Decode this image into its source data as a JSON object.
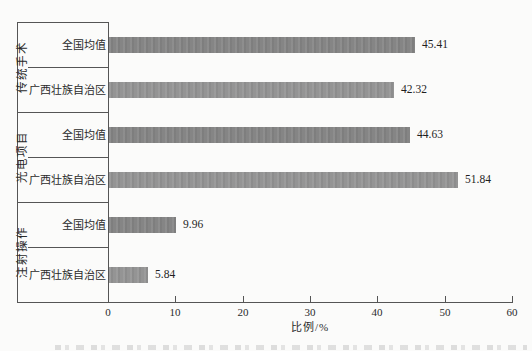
{
  "chart_data": {
    "type": "bar",
    "orientation": "horizontal",
    "title": "",
    "xlabel": "比例/%",
    "ylabel": "",
    "xlim": [
      0,
      60
    ],
    "xticks": [
      "0",
      "10",
      "20",
      "30",
      "40",
      "50",
      "60"
    ],
    "grid": false,
    "legend": "none",
    "groups": [
      {
        "label": "传统手术",
        "rows": [
          {
            "label": "全国均值",
            "value": 45.41,
            "value_label": "45.41"
          },
          {
            "label": "广西壮族自治区",
            "value": 42.32,
            "value_label": "42.32"
          }
        ]
      },
      {
        "label": "光电项目",
        "rows": [
          {
            "label": "全国均值",
            "value": 44.63,
            "value_label": "44.63"
          },
          {
            "label": "广西壮族自治区",
            "value": 51.84,
            "value_label": "51.84"
          }
        ]
      },
      {
        "label": "注射操作",
        "rows": [
          {
            "label": "全国均值",
            "value": 9.96,
            "value_label": "9.96"
          },
          {
            "label": "广西壮族自治区",
            "value": 5.84,
            "value_label": "5.84"
          }
        ]
      }
    ],
    "series_note": "darker bars = 全国均值, lighter bars = 广西壮族自治区",
    "colors": {
      "bar_national": "#858585",
      "bar_guangxi": "#949494",
      "axis": "#555555",
      "text": "#2a2a2a",
      "background": "#fbfbfa"
    }
  }
}
